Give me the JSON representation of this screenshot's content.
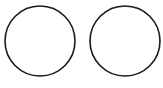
{
  "canvas": {
    "width": 163,
    "height": 88,
    "background": "#ffffff"
  },
  "shapes": [
    {
      "type": "circle",
      "cx": 40,
      "cy": 41,
      "r": 35,
      "stroke": "#1a1a1a",
      "stroke_width": 1.6,
      "fill": "none"
    },
    {
      "type": "circle",
      "cx": 125,
      "cy": 41,
      "r": 35,
      "stroke": "#1a1a1a",
      "stroke_width": 1.6,
      "fill": "none"
    }
  ]
}
